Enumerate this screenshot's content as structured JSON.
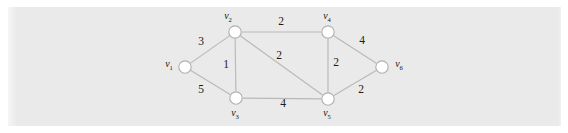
{
  "figure": {
    "background_color": "#eaeaea",
    "page_color": "#ffffff",
    "edge_color": "#b9b9b9",
    "node_fill": "#ffffff",
    "node_stroke": "#b0b0b0",
    "text_color": "#111111"
  },
  "graph": {
    "type": "weighted-undirected-graph",
    "nodes": [
      {
        "id": "v1",
        "label": "v",
        "subscript": "1",
        "x": 185,
        "y": 67,
        "r": 6.2,
        "label_x": 169,
        "label_y": 65
      },
      {
        "id": "v2",
        "label": "v",
        "subscript": "2",
        "x": 235,
        "y": 32,
        "r": 6.2,
        "label_x": 228,
        "label_y": 17
      },
      {
        "id": "v3",
        "label": "v",
        "subscript": "3",
        "x": 236,
        "y": 98,
        "r": 6.2,
        "label_x": 235,
        "label_y": 114
      },
      {
        "id": "v4",
        "label": "v",
        "subscript": "4",
        "x": 328,
        "y": 32,
        "r": 6.2,
        "label_x": 327,
        "label_y": 17
      },
      {
        "id": "v5",
        "label": "v",
        "subscript": "5",
        "x": 328,
        "y": 99,
        "r": 6.2,
        "label_x": 327,
        "label_y": 114
      },
      {
        "id": "v6",
        "label": "v",
        "subscript": "6",
        "x": 382,
        "y": 67,
        "r": 6.2,
        "label_x": 399,
        "label_y": 65
      }
    ],
    "edges": [
      {
        "id": "e-v1-v2",
        "from": "v1",
        "to": "v2",
        "weight": "3",
        "label_x": 201,
        "label_y": 42
      },
      {
        "id": "e-v1-v3",
        "from": "v1",
        "to": "v3",
        "weight": "5",
        "label_x": 201,
        "label_y": 90
      },
      {
        "id": "e-v2-v3",
        "from": "v2",
        "to": "v3",
        "weight": "1",
        "label_x": 226,
        "label_y": 65
      },
      {
        "id": "e-v2-v4",
        "from": "v2",
        "to": "v4",
        "weight": "2",
        "label_x": 281,
        "label_y": 22
      },
      {
        "id": "e-v2-v5",
        "from": "v2",
        "to": "v5",
        "weight": "2",
        "label_x": 279,
        "label_y": 56
      },
      {
        "id": "e-v3-v5",
        "from": "v3",
        "to": "v5",
        "weight": "4",
        "label_x": 283,
        "label_y": 104
      },
      {
        "id": "e-v4-v5",
        "from": "v4",
        "to": "v5",
        "weight": "2",
        "label_x": 336,
        "label_y": 63
      },
      {
        "id": "e-v4-v6",
        "from": "v4",
        "to": "v6",
        "weight": "4",
        "label_x": 362,
        "label_y": 41
      },
      {
        "id": "e-v5-v6",
        "from": "v5",
        "to": "v6",
        "weight": "2",
        "label_x": 361,
        "label_y": 90
      }
    ]
  }
}
